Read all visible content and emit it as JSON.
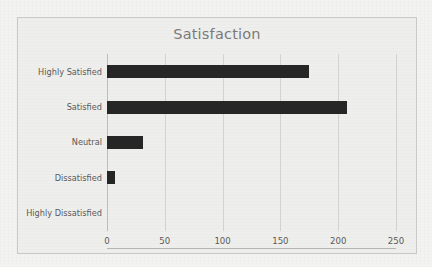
{
  "chart": {
    "title": "Satisfaction"
  },
  "chart_data": {
    "type": "bar",
    "orientation": "horizontal",
    "title": "Satisfaction",
    "xlabel": "",
    "ylabel": "",
    "categories": [
      "Highly Satisfied",
      "Satisfied",
      "Neutral",
      "Dissatisfied",
      "Highly Dissatisfied"
    ],
    "values": [
      175,
      208,
      31,
      7,
      0
    ],
    "xlim": [
      0,
      250
    ],
    "xticks": [
      0,
      50,
      100,
      150,
      200,
      250
    ],
    "xtick_labels": [
      "0",
      "50",
      "100",
      "150",
      "200",
      "250"
    ],
    "grid": "vertical",
    "legend": "none",
    "series": [
      {
        "name": "Count",
        "values": [
          175,
          208,
          31,
          7,
          0
        ]
      }
    ],
    "colors": {
      "bar": "#262626",
      "gridline": "#d2d2d2",
      "axis": "#b4b4b4",
      "title_text": "#7a7a7a",
      "label_text": "#5a5a5a",
      "plot_background": "#eeeeec",
      "frame_border": "#c9c9c9"
    }
  }
}
